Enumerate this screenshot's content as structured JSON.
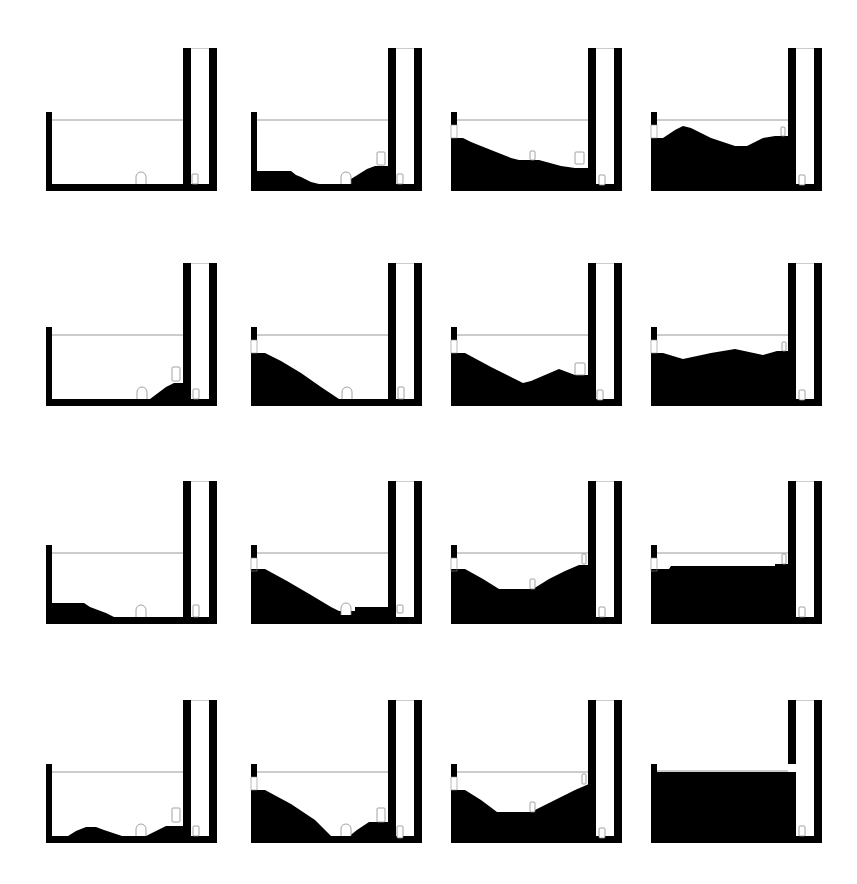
{
  "figure": {
    "rows": 4,
    "cols": 4,
    "colors": {
      "terrain": "#000000",
      "background": "#ffffff",
      "waterline": "#9a9a9a",
      "object_outline": "#8a8a8a"
    },
    "col_x": [
      46,
      251,
      451,
      651
    ],
    "row_y": [
      48,
      263,
      481,
      700
    ],
    "panels": [
      {
        "id": "r1c1",
        "left_cap": false,
        "terrain": [
          [
            0,
            136
          ],
          [
            170,
            136
          ]
        ],
        "objects": [
          {
            "type": "arch",
            "x": 90,
            "y": 124
          },
          {
            "type": "box",
            "x": 146,
            "y": 126,
            "w": 6,
            "h": 10
          }
        ],
        "full": false
      },
      {
        "id": "r1c2",
        "left_cap": false,
        "terrain": [
          [
            0,
            123
          ],
          [
            40,
            123
          ],
          [
            45,
            127
          ],
          [
            50,
            129
          ],
          [
            60,
            134
          ],
          [
            68,
            136
          ],
          [
            92,
            136
          ],
          [
            100,
            131
          ],
          [
            108,
            126
          ],
          [
            116,
            121
          ],
          [
            124,
            118
          ],
          [
            138,
            118
          ]
        ],
        "objects": [
          {
            "type": "arch",
            "x": 90,
            "y": 124
          },
          {
            "type": "box",
            "x": 126,
            "y": 104,
            "w": 8,
            "h": 13
          },
          {
            "type": "box",
            "x": 146,
            "y": 126,
            "w": 6,
            "h": 10
          }
        ],
        "full": false
      },
      {
        "id": "r1c3",
        "left_cap": true,
        "terrain": [
          [
            0,
            90
          ],
          [
            12,
            90
          ],
          [
            20,
            94
          ],
          [
            40,
            102
          ],
          [
            60,
            110
          ],
          [
            68,
            112
          ],
          [
            88,
            112
          ],
          [
            110,
            118
          ],
          [
            124,
            120
          ],
          [
            138,
            120
          ]
        ],
        "objects": [
          {
            "type": "box",
            "x": 79,
            "y": 103,
            "w": 5,
            "h": 9
          },
          {
            "type": "box",
            "x": 124,
            "y": 104,
            "w": 9,
            "h": 12
          },
          {
            "type": "box",
            "x": 148,
            "y": 127,
            "w": 6,
            "h": 10
          }
        ],
        "full": false
      },
      {
        "id": "r1c4",
        "left_cap": true,
        "terrain": [
          [
            0,
            90
          ],
          [
            12,
            90
          ],
          [
            24,
            82
          ],
          [
            32,
            78
          ],
          [
            40,
            80
          ],
          [
            60,
            90
          ],
          [
            84,
            98
          ],
          [
            96,
            98
          ],
          [
            112,
            90
          ],
          [
            124,
            88
          ],
          [
            140,
            88
          ]
        ],
        "objects": [
          {
            "type": "box",
            "x": 130,
            "y": 79,
            "w": 4,
            "h": 9
          },
          {
            "type": "box",
            "x": 148,
            "y": 127,
            "w": 6,
            "h": 10
          }
        ],
        "full": false
      },
      {
        "id": "r2c1",
        "left_cap": false,
        "terrain": [
          [
            0,
            136
          ],
          [
            104,
            136
          ],
          [
            112,
            130
          ],
          [
            120,
            124
          ],
          [
            128,
            120
          ],
          [
            137,
            120
          ]
        ],
        "objects": [
          {
            "type": "arch",
            "x": 91,
            "y": 124
          },
          {
            "type": "box",
            "x": 126,
            "y": 104,
            "w": 8,
            "h": 14
          },
          {
            "type": "box",
            "x": 147,
            "y": 126,
            "w": 6,
            "h": 10
          }
        ],
        "full": false
      },
      {
        "id": "r2c2",
        "left_cap": true,
        "terrain": [
          [
            0,
            90
          ],
          [
            14,
            90
          ],
          [
            30,
            98
          ],
          [
            50,
            110
          ],
          [
            70,
            124
          ],
          [
            88,
            136
          ],
          [
            137,
            136
          ]
        ],
        "objects": [
          {
            "type": "arch",
            "x": 91,
            "y": 124
          },
          {
            "type": "box",
            "x": 147,
            "y": 124,
            "w": 6,
            "h": 12
          }
        ],
        "full": false
      },
      {
        "id": "r2c3",
        "left_cap": true,
        "terrain": [
          [
            0,
            90
          ],
          [
            14,
            90
          ],
          [
            40,
            104
          ],
          [
            72,
            120
          ],
          [
            80,
            118
          ],
          [
            108,
            106
          ],
          [
            124,
            112
          ],
          [
            138,
            112
          ]
        ],
        "objects": [
          {
            "type": "box",
            "x": 124,
            "y": 100,
            "w": 10,
            "h": 12
          },
          {
            "type": "box",
            "x": 146,
            "y": 127,
            "w": 6,
            "h": 10
          }
        ],
        "full": false
      },
      {
        "id": "r2c4",
        "left_cap": true,
        "terrain": [
          [
            0,
            90
          ],
          [
            12,
            90
          ],
          [
            32,
            96
          ],
          [
            60,
            90
          ],
          [
            84,
            86
          ],
          [
            112,
            92
          ],
          [
            126,
            88
          ],
          [
            138,
            88
          ]
        ],
        "objects": [
          {
            "type": "box",
            "x": 131,
            "y": 79,
            "w": 4,
            "h": 9
          },
          {
            "type": "box",
            "x": 148,
            "y": 127,
            "w": 6,
            "h": 10
          }
        ],
        "full": false
      },
      {
        "id": "r3c1",
        "left_cap": false,
        "terrain": [
          [
            0,
            122
          ],
          [
            38,
            122
          ],
          [
            44,
            126
          ],
          [
            60,
            132
          ],
          [
            68,
            136
          ],
          [
            137,
            136
          ]
        ],
        "objects": [
          {
            "type": "arch",
            "x": 90,
            "y": 124
          },
          {
            "type": "box",
            "x": 147,
            "y": 124,
            "w": 6,
            "h": 12
          }
        ],
        "full": false
      },
      {
        "id": "r3c2",
        "left_cap": true,
        "terrain": [
          [
            0,
            88
          ],
          [
            14,
            88
          ],
          [
            36,
            100
          ],
          [
            60,
            114
          ],
          [
            80,
            126
          ],
          [
            88,
            130
          ],
          [
            104,
            130
          ],
          [
            104,
            126
          ],
          [
            137,
            126
          ],
          [
            137,
            130
          ]
        ],
        "objects": [
          {
            "type": "arch",
            "x": 90,
            "y": 122
          },
          {
            "type": "box",
            "x": 146,
            "y": 124,
            "w": 6,
            "h": 8
          }
        ],
        "full": false
      },
      {
        "id": "r3c3",
        "left_cap": true,
        "terrain": [
          [
            0,
            88
          ],
          [
            14,
            88
          ],
          [
            32,
            98
          ],
          [
            48,
            108
          ],
          [
            82,
            108
          ],
          [
            98,
            98
          ],
          [
            114,
            90
          ],
          [
            128,
            84
          ],
          [
            138,
            84
          ]
        ],
        "objects": [
          {
            "type": "box",
            "x": 79,
            "y": 98,
            "w": 5,
            "h": 10
          },
          {
            "type": "box",
            "x": 131,
            "y": 73,
            "w": 4,
            "h": 10
          },
          {
            "type": "box",
            "x": 148,
            "y": 126,
            "w": 6,
            "h": 10
          }
        ],
        "full": false
      },
      {
        "id": "r3c4",
        "left_cap": true,
        "terrain": [
          [
            0,
            88
          ],
          [
            18,
            88
          ],
          [
            20,
            85
          ],
          [
            124,
            85
          ],
          [
            124,
            83
          ],
          [
            138,
            83
          ]
        ],
        "objects": [
          {
            "type": "box",
            "x": 131,
            "y": 73,
            "w": 4,
            "h": 10
          },
          {
            "type": "box",
            "x": 148,
            "y": 126,
            "w": 6,
            "h": 10
          }
        ],
        "full": false
      },
      {
        "id": "r4c1",
        "left_cap": false,
        "terrain": [
          [
            0,
            136
          ],
          [
            22,
            136
          ],
          [
            30,
            131
          ],
          [
            40,
            127
          ],
          [
            50,
            127
          ],
          [
            58,
            130
          ],
          [
            70,
            134
          ],
          [
            82,
            138
          ],
          [
            96,
            138
          ],
          [
            104,
            134
          ],
          [
            112,
            130
          ],
          [
            120,
            126
          ],
          [
            130,
            126
          ],
          [
            137,
            126
          ]
        ],
        "objects": [
          {
            "type": "arch",
            "x": 90,
            "y": 124
          },
          {
            "type": "box",
            "x": 126,
            "y": 108,
            "w": 8,
            "h": 14
          },
          {
            "type": "box",
            "x": 147,
            "y": 126,
            "w": 6,
            "h": 10
          }
        ],
        "full": false
      },
      {
        "id": "r4c2",
        "left_cap": true,
        "terrain": [
          [
            0,
            90
          ],
          [
            14,
            90
          ],
          [
            40,
            104
          ],
          [
            64,
            120
          ],
          [
            82,
            138
          ],
          [
            96,
            138
          ],
          [
            106,
            130
          ],
          [
            118,
            122
          ],
          [
            137,
            122
          ]
        ],
        "objects": [
          {
            "type": "arch",
            "x": 90,
            "y": 124
          },
          {
            "type": "box",
            "x": 126,
            "y": 108,
            "w": 8,
            "h": 14
          },
          {
            "type": "box",
            "x": 146,
            "y": 126,
            "w": 6,
            "h": 12
          }
        ],
        "full": false
      },
      {
        "id": "r4c3",
        "left_cap": true,
        "terrain": [
          [
            0,
            90
          ],
          [
            14,
            90
          ],
          [
            30,
            100
          ],
          [
            46,
            112
          ],
          [
            80,
            112
          ],
          [
            96,
            104
          ],
          [
            112,
            96
          ],
          [
            124,
            90
          ],
          [
            138,
            84
          ]
        ],
        "objects": [
          {
            "type": "box",
            "x": 79,
            "y": 102,
            "w": 5,
            "h": 10
          },
          {
            "type": "box",
            "x": 131,
            "y": 74,
            "w": 4,
            "h": 10
          },
          {
            "type": "box",
            "x": 148,
            "y": 128,
            "w": 6,
            "h": 10
          }
        ],
        "full": false
      },
      {
        "id": "r4c4",
        "left_cap": true,
        "terrain": [],
        "objects": [
          {
            "type": "box",
            "x": 148,
            "y": 126,
            "w": 6,
            "h": 10
          }
        ],
        "full": true
      }
    ]
  }
}
